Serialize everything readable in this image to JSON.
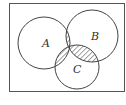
{
  "diagram": {
    "type": "venn",
    "sets": [
      {
        "label": "A",
        "cx": 44,
        "cy": 43,
        "r": 26
      },
      {
        "label": "B",
        "cx": 92,
        "cy": 36,
        "r": 26
      },
      {
        "label": "C",
        "cx": 77,
        "cy": 67,
        "r": 22
      }
    ],
    "shaded_regions": [
      "A∩B only",
      "A∩C only",
      "B∩C only"
    ],
    "colors": {
      "stroke": "#444444",
      "hatch": "#444444",
      "background": "#ffffff"
    }
  },
  "labels": {
    "a": "A",
    "b": "B",
    "c": "C"
  }
}
